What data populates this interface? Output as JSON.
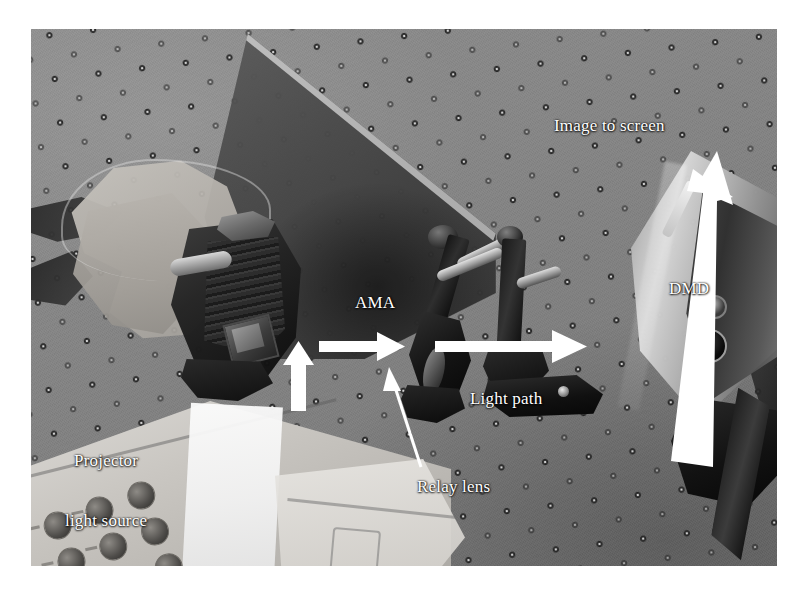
{
  "figure": {
    "kind": "annotated-photograph",
    "background_color": "#ffffff",
    "photo_frame": {
      "x": 31,
      "y": 29,
      "width": 746,
      "height": 537
    }
  },
  "scene": {
    "optical_table": {
      "name": "optical breadboard",
      "surface_color": "#868686",
      "hole_pattern": "regular square grid of mounting holes"
    },
    "components": [
      {
        "name": "baffle-board",
        "label": "dark foam light baffle",
        "color": "#3e3e3e"
      },
      {
        "name": "foam-wrap",
        "label": "light foam wrap around AMA",
        "color": "#b6b2ac"
      },
      {
        "name": "ama-assembly",
        "label": "AMA circuit board assembly",
        "color": "#1b1b1b"
      },
      {
        "name": "relay-lens-mount",
        "label": "relay lens in post mount",
        "color": "#151515"
      },
      {
        "name": "post-assembly",
        "label": "optical post and clamp",
        "color": "#1a1a1a"
      },
      {
        "name": "dmd-unit",
        "label": "DMD metallic enclosure",
        "color": "#b5b5b5"
      },
      {
        "name": "projector-housing",
        "label": "projector body with keypad",
        "color": "#c9c6c1"
      }
    ]
  },
  "annotations": {
    "labels": [
      {
        "id": "image-to-screen",
        "text": "Image to screen",
        "color": "#ffffff"
      },
      {
        "id": "dmd",
        "text": "DMD",
        "color": "#ffffff"
      },
      {
        "id": "ama",
        "text": "AMA",
        "color": "#ffffff"
      },
      {
        "id": "light-path",
        "text": "Light path",
        "color": "#ffffff"
      },
      {
        "id": "relay-lens",
        "text": "Relay lens",
        "color": "#ffffff"
      },
      {
        "id": "projector-line1",
        "text": "Projector",
        "color": "#ffffff"
      },
      {
        "id": "projector-line2",
        "text": "light source",
        "color": "#ffffff"
      }
    ],
    "arrows": [
      {
        "id": "arrow-image-to-screen",
        "style": "thick-filled",
        "direction": "up-right",
        "color": "#ffffff"
      },
      {
        "id": "arrow-source-up",
        "style": "thick-filled",
        "direction": "up",
        "color": "#ffffff"
      },
      {
        "id": "arrow-ama-to-lens",
        "style": "thick-filled",
        "direction": "right",
        "color": "#ffffff"
      },
      {
        "id": "arrow-lens-to-dmd",
        "style": "thick-filled",
        "direction": "right",
        "color": "#ffffff"
      },
      {
        "id": "arrow-relay-lens-pointer",
        "style": "thin-line",
        "direction": "up-left",
        "color": "#ffffff"
      }
    ]
  }
}
